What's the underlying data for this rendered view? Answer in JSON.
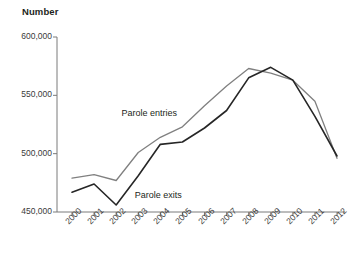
{
  "chart_data": {
    "type": "line",
    "title": "Number",
    "xlabel": "",
    "ylabel": "Number",
    "grid": false,
    "legend_position": "inline-annotation",
    "x": [
      "2000",
      "2001",
      "2002",
      "2003",
      "2004",
      "2005",
      "2006",
      "2007",
      "2008",
      "2009",
      "2010",
      "2011",
      "2012"
    ],
    "ylim": [
      450000,
      600000
    ],
    "yticks": [
      450000,
      500000,
      550000,
      600000
    ],
    "ytick_labels": [
      "450,000",
      "500,000",
      "550,000",
      "600,000"
    ],
    "series": [
      {
        "name": "Parole entries",
        "color": "#808080",
        "values": [
          479000,
          482000,
          477000,
          501000,
          514000,
          523000,
          541000,
          558000,
          573000,
          569000,
          563000,
          545000,
          496000
        ]
      },
      {
        "name": "Parole exits",
        "color": "#262626",
        "values": [
          467000,
          474000,
          456000,
          481000,
          508000,
          510000,
          522000,
          537000,
          565000,
          574000,
          563000,
          532000,
          498000
        ]
      }
    ],
    "annotations": [
      {
        "text": "Parole entries",
        "x": 2003.6,
        "y": 534000
      },
      {
        "text": "Parole exits",
        "x": 2004.2,
        "y": 464000
      }
    ]
  },
  "axis": {
    "title": "Number"
  }
}
